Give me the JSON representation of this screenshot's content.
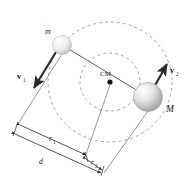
{
  "figure": {
    "background_color": "#ffffff",
    "line_color": "#3a3a3a",
    "dashed_color": "#9a9a9a",
    "label_color": "#1a1a1a"
  },
  "bodies": {
    "small_mass": {
      "label": "m",
      "cx": 62,
      "cy": 45,
      "r": 9.5,
      "fill_light": "#ffffff",
      "fill_dark": "#c9c9c9"
    },
    "large_mass": {
      "label": "M",
      "cx": 148,
      "cy": 97,
      "r": 14.5,
      "fill_light": "#ffffff",
      "fill_dark": "#a8a8a8"
    }
  },
  "center_of_mass": {
    "label": "CM",
    "cx": 110,
    "cy": 82,
    "r": 2.6
  },
  "vectors": [
    {
      "name": "velocity-small-mass",
      "label": "v",
      "subscript": "1",
      "x1": 56,
      "y1": 52,
      "x2": 33,
      "y2": 90
    },
    {
      "name": "velocity-large-mass",
      "label": "v",
      "subscript": "2",
      "x1": 154,
      "y1": 88,
      "x2": 168,
      "y2": 62
    }
  ],
  "orbits": [
    {
      "name": "orbit-small-mass",
      "cx": 110,
      "cy": 82,
      "rx": 62,
      "ry": 60,
      "dash": "3,3"
    },
    {
      "name": "orbit-large-mass",
      "cx": 110,
      "cy": 82,
      "rx": 30,
      "ry": 29,
      "dash": "3,3"
    }
  ],
  "dimensions": [
    {
      "name": "r1",
      "label": "r",
      "subscript": "1",
      "label_x": 50,
      "label_y": 141,
      "x1": 18,
      "y1": 124,
      "x2": 88,
      "y2": 155
    },
    {
      "name": "d",
      "label": "d",
      "subscript": "",
      "label_x": 40,
      "label_y": 163,
      "x1": 13,
      "y1": 133,
      "x2": 102,
      "y2": 174
    },
    {
      "name": "r2",
      "label": "r",
      "subscript": "2",
      "label_x": 93,
      "label_y": 164,
      "x1": 83,
      "y1": 158,
      "x2": 103,
      "y2": 172
    }
  ],
  "projection_lines": [
    {
      "name": "projection-small-mass",
      "x1": 62,
      "y1": 54,
      "x2": 18,
      "y2": 124
    },
    {
      "name": "projection-center-of-mass",
      "x1": 110,
      "y1": 85,
      "x2": 85,
      "y2": 157
    },
    {
      "name": "projection-large-mass",
      "x1": 148,
      "y1": 111,
      "x2": 104,
      "y2": 173
    }
  ],
  "connector": {
    "name": "separation-line",
    "x1": 62,
    "y1": 45,
    "x2": 148,
    "y2": 97
  }
}
